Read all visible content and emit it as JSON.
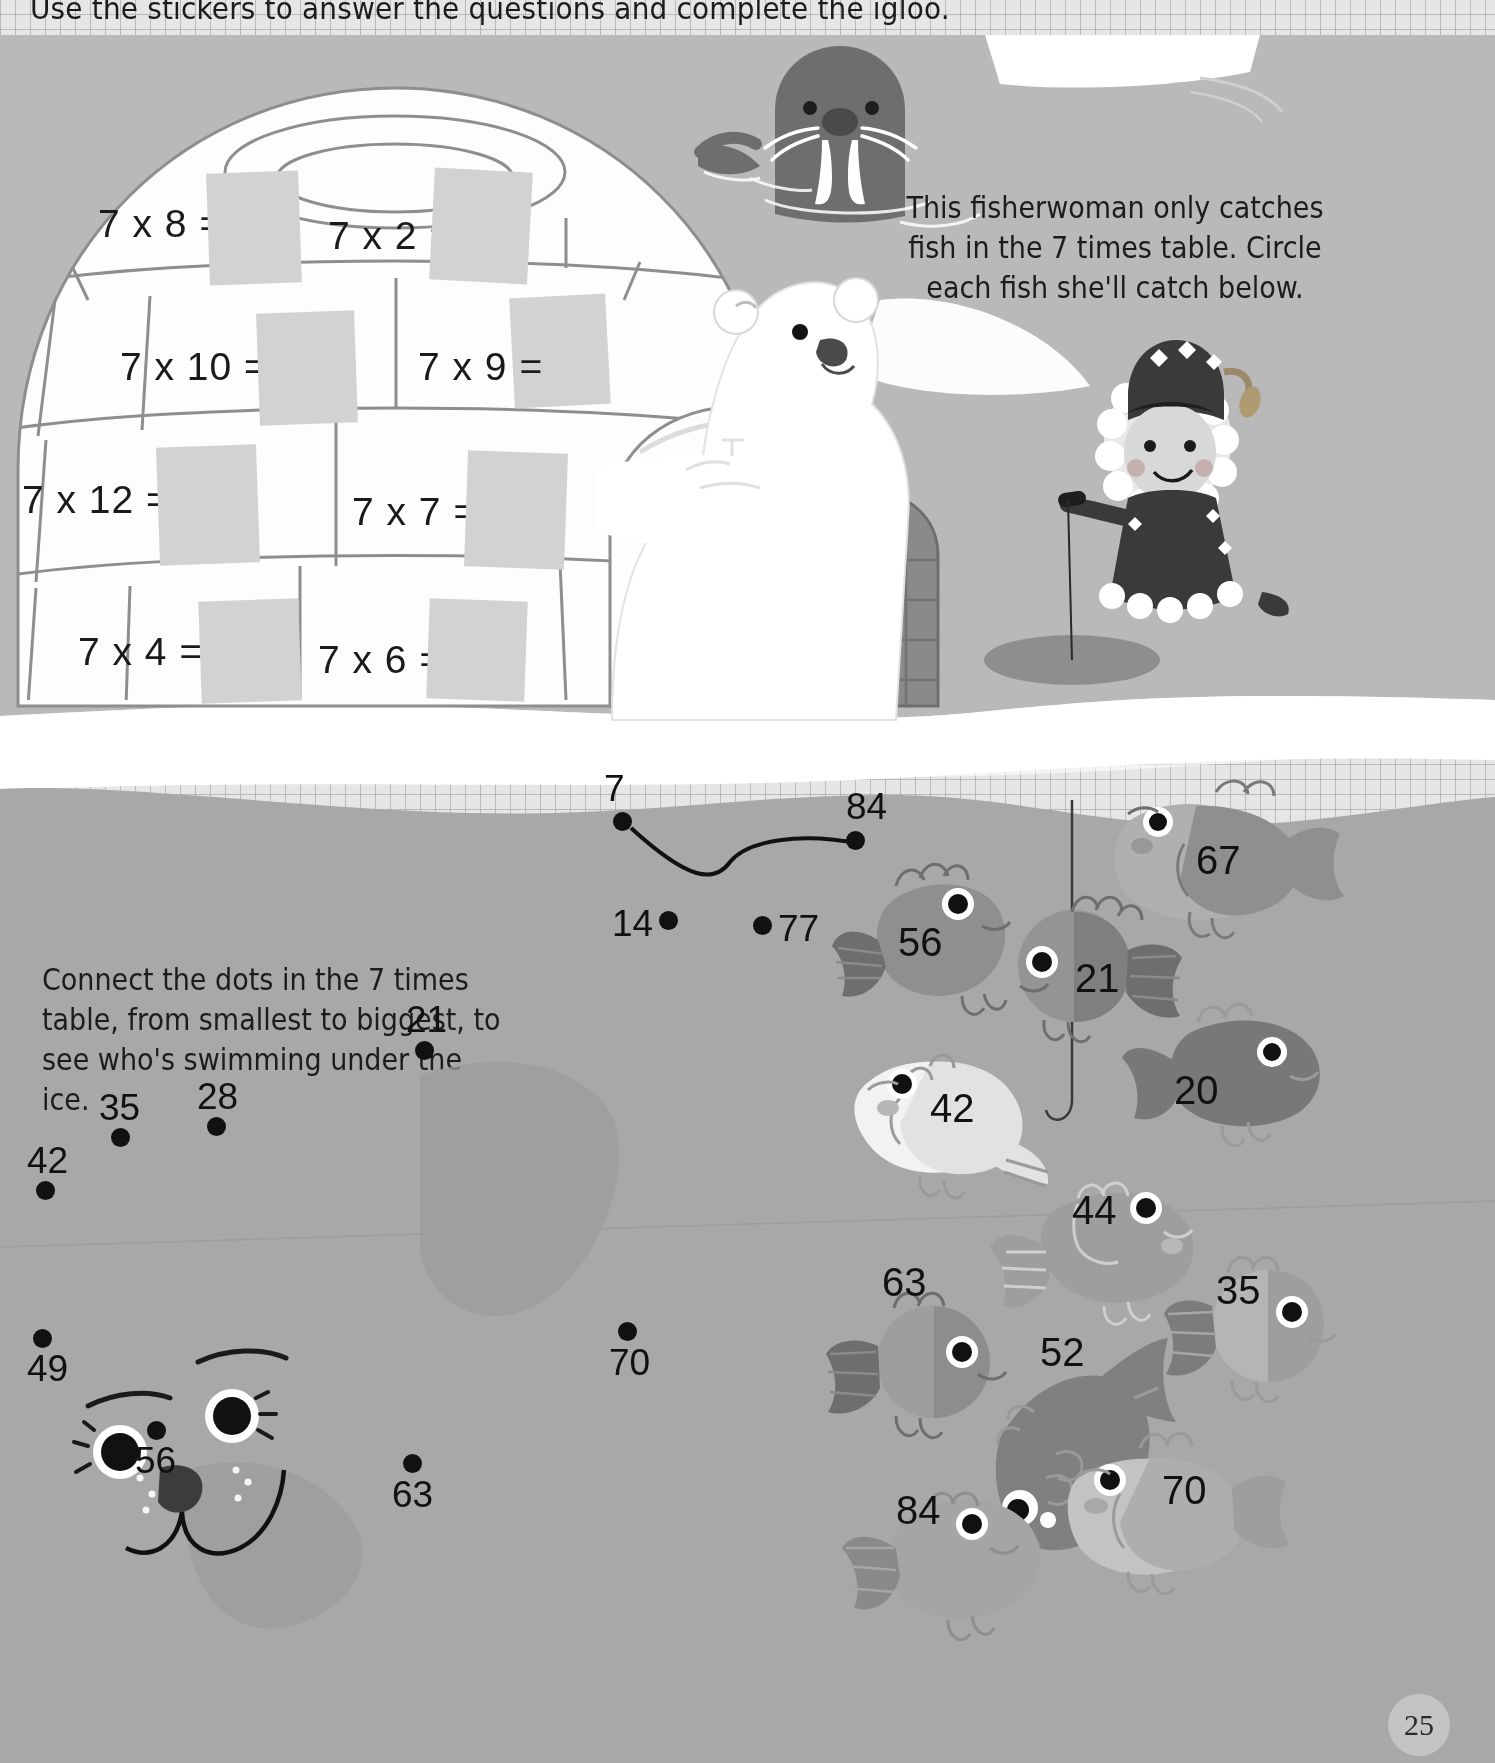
{
  "page": {
    "title": "Use the stickers to answer the questions and complete the igloo.",
    "page_number": "25",
    "colors": {
      "ice_grid": "#e6e6e6",
      "snow_band": "#b9b9b9",
      "water": "#a8a8a8",
      "igloo_white": "#fdfdfd",
      "sticker_slot": "#d2d2d2",
      "ink": "#1a1a1a"
    }
  },
  "igloo_activity": {
    "equations": [
      {
        "label": "7 x 8 =",
        "answer_slot": ""
      },
      {
        "label": "7 x 2 =",
        "answer_slot": ""
      },
      {
        "label": "7 x 10 =",
        "answer_slot": ""
      },
      {
        "label": "7 x 9 =",
        "answer_slot": ""
      },
      {
        "label": "7 x 12 =",
        "answer_slot": ""
      },
      {
        "label": "7 x 7 =",
        "answer_slot": ""
      },
      {
        "label": "7 x 4 =",
        "answer_slot": ""
      },
      {
        "label": "7 x 6 =",
        "answer_slot": ""
      }
    ]
  },
  "fisherwoman_activity": {
    "instruction": "This fisherwoman only catches fish in the 7 times table. Circle each fish she'll catch below.",
    "fish": [
      {
        "number": "67",
        "shade": "#9a9a9a"
      },
      {
        "number": "56",
        "shade": "#8f8f8f"
      },
      {
        "number": "21",
        "shade": "#949494"
      },
      {
        "number": "20",
        "shade": "#787878"
      },
      {
        "number": "42",
        "shade": "#ededed"
      },
      {
        "number": "44",
        "shade": "#9e9e9e"
      },
      {
        "number": "63",
        "shade": "#8d8d8d"
      },
      {
        "number": "35",
        "shade": "#b5b5b5"
      },
      {
        "number": "52",
        "shade": "#808080"
      },
      {
        "number": "84",
        "shade": "#a5a5a5"
      },
      {
        "number": "70",
        "shade": "#c3c3c3"
      }
    ]
  },
  "dot_to_dot_activity": {
    "instruction": "Connect the dots in the 7 times table, from smallest to biggest, to see who's swimming under the ice.",
    "dots": [
      {
        "number": "7",
        "x": 622,
        "y": 820
      },
      {
        "number": "84",
        "x": 855,
        "y": 840
      },
      {
        "number": "14",
        "x": 668,
        "y": 920
      },
      {
        "number": "77",
        "x": 762,
        "y": 925
      },
      {
        "number": "21",
        "x": 424,
        "y": 1050
      },
      {
        "number": "28",
        "x": 216,
        "y": 1126
      },
      {
        "number": "35",
        "x": 120,
        "y": 1137
      },
      {
        "number": "42",
        "x": 45,
        "y": 1190
      },
      {
        "number": "49",
        "x": 42,
        "y": 1338
      },
      {
        "number": "56",
        "x": 156,
        "y": 1430
      },
      {
        "number": "63",
        "x": 412,
        "y": 1463
      },
      {
        "number": "70",
        "x": 627,
        "y": 1331
      }
    ]
  }
}
